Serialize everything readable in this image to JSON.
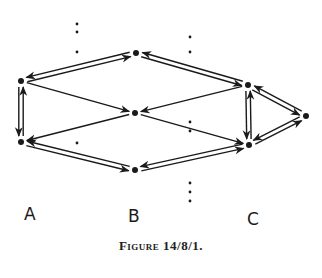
{
  "figure": {
    "caption": "Figure 14/8/1.",
    "labels": [
      {
        "id": "A",
        "text": "A",
        "x": 24,
        "y": 212
      },
      {
        "id": "B",
        "text": "B",
        "x": 128,
        "y": 214
      },
      {
        "id": "C",
        "text": "C",
        "x": 247,
        "y": 217
      }
    ],
    "ink_color": "#1a1a1a"
  },
  "graph": {
    "nodes": [
      {
        "id": "A1",
        "x": 21,
        "y": 81
      },
      {
        "id": "A2",
        "x": 21,
        "y": 142
      },
      {
        "id": "B1",
        "x": 136,
        "y": 53
      },
      {
        "id": "B2",
        "x": 135,
        "y": 113
      },
      {
        "id": "B3",
        "x": 135,
        "y": 170
      },
      {
        "id": "C1",
        "x": 248,
        "y": 85
      },
      {
        "id": "C2",
        "x": 249,
        "y": 145
      },
      {
        "id": "C3",
        "x": 306,
        "y": 116
      }
    ],
    "edges": [
      {
        "from": "A1",
        "to": "B1",
        "double": true
      },
      {
        "from": "A1",
        "to": "B2",
        "double": false
      },
      {
        "from": "B2",
        "to": "A2",
        "double": false
      },
      {
        "from": "A2",
        "to": "B3",
        "double": true
      },
      {
        "from": "A1",
        "to": "A2",
        "double": true
      },
      {
        "from": "B1",
        "to": "C1",
        "double": true
      },
      {
        "from": "C1",
        "to": "B2",
        "double": false
      },
      {
        "from": "B2",
        "to": "C2",
        "double": false
      },
      {
        "from": "B3",
        "to": "C2",
        "double": true
      },
      {
        "from": "C1",
        "to": "C2",
        "double": true
      },
      {
        "from": "C1",
        "to": "C3",
        "double": true
      },
      {
        "from": "C3",
        "to": "C2",
        "double": true
      }
    ],
    "dots": [
      [
        77,
        24
      ],
      [
        77,
        32
      ],
      [
        77,
        52
      ],
      [
        190,
        37
      ],
      [
        190,
        52
      ],
      [
        190,
        122
      ],
      [
        190,
        131
      ],
      [
        77,
        143
      ],
      [
        190,
        183
      ],
      [
        190,
        192
      ],
      [
        190,
        201
      ]
    ]
  }
}
